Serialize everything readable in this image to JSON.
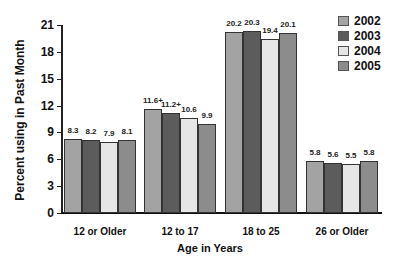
{
  "chart_data": {
    "type": "bar",
    "title": "",
    "xlabel": "Age in Years",
    "ylabel": "Percent using in Past Month",
    "ylim": [
      0,
      21
    ],
    "yticks": [
      0,
      3,
      6,
      9,
      12,
      15,
      18,
      21
    ],
    "grid": false,
    "legend_position": "top-right",
    "categories": [
      "12 or Older",
      "12 to 17",
      "18 to 25",
      "26 or Older"
    ],
    "series": [
      {
        "name": "2002",
        "color": "#a3a3a3",
        "values": [
          8.3,
          11.6,
          20.2,
          5.8
        ],
        "labels": [
          "8.3",
          "11.6+",
          "20.2",
          "5.8"
        ]
      },
      {
        "name": "2003",
        "color": "#5c5c5c",
        "values": [
          8.2,
          11.2,
          20.3,
          5.6
        ],
        "labels": [
          "8.2",
          "11.2+",
          "20.3",
          "5.6"
        ]
      },
      {
        "name": "2004",
        "color": "#e6e6e6",
        "values": [
          7.9,
          10.6,
          19.4,
          5.5
        ],
        "labels": [
          "7.9",
          "10.6",
          "19.4",
          "5.5"
        ]
      },
      {
        "name": "2005",
        "color": "#8c8c8c",
        "values": [
          8.1,
          9.9,
          20.1,
          5.8
        ],
        "labels": [
          "8.1",
          "9.9",
          "20.1",
          "5.8"
        ]
      }
    ],
    "annotations": [
      "+ marks on 2002 and 2003 values for 12 to 17 age group"
    ]
  }
}
